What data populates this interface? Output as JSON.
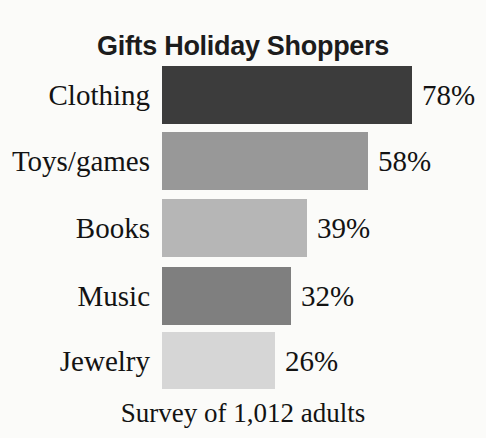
{
  "title_line1": "Gifts Holiday Shoppers",
  "title_line2": "Plan to Buy",
  "caption": "Survey of 1,012 adults",
  "chart_data": {
    "type": "bar",
    "orientation": "horizontal",
    "title": "Gifts Holiday Shoppers Plan to Buy",
    "note": "Survey of 1,012 adults",
    "categories": [
      "Clothing",
      "Toys/games",
      "Books",
      "Music",
      "Jewelry"
    ],
    "values": [
      78,
      58,
      39,
      32,
      26
    ],
    "value_labels": [
      "78%",
      "58%",
      "39%",
      "32%",
      "26%"
    ],
    "unit": "percent",
    "bar_colors": [
      "#3c3c3c",
      "#989898",
      "#b6b6b6",
      "#7f7f7f",
      "#d6d6d6"
    ],
    "legend": false,
    "grid": false,
    "axes_shown": false,
    "layout_hints": {
      "bar_left_px": 162,
      "bar_widths_px": [
        250,
        206,
        145,
        129,
        113
      ],
      "row_tops_px": [
        66,
        132,
        199,
        267,
        332
      ],
      "row_heights_px": [
        58,
        58,
        58,
        58,
        57
      ],
      "value_label_gap_px": 10
    }
  }
}
